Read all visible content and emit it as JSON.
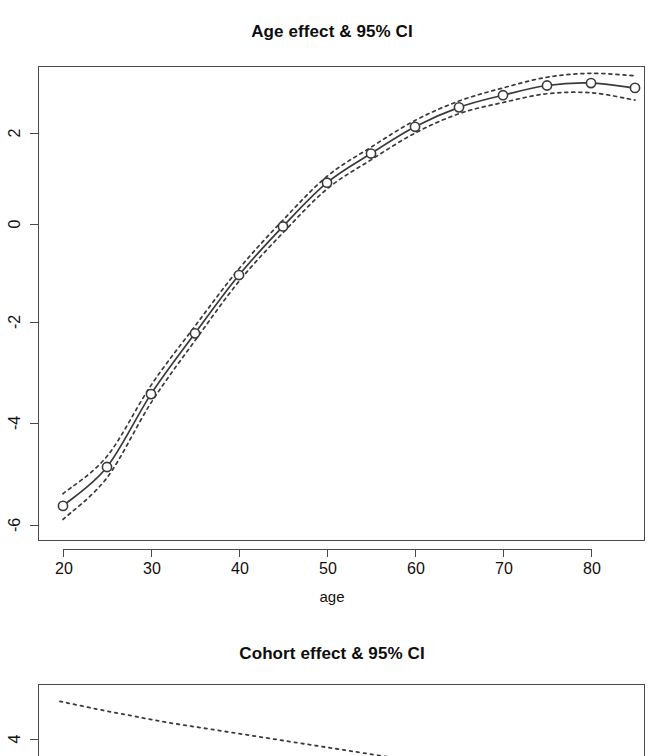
{
  "figure": {
    "background": "#ffffff",
    "line_color": "#3a3a3a",
    "box_color": "#4a4a4a",
    "text_color": "#111111"
  },
  "panels": [
    {
      "id": "age-panel",
      "title": "Age effect & 95% CI",
      "xlabel": "age",
      "ylabel": "",
      "x_ticks": [
        "20",
        "30",
        "40",
        "50",
        "60",
        "70",
        "80"
      ],
      "y_ticks": [
        "2",
        "0",
        "-2",
        "-4",
        "-6"
      ]
    },
    {
      "id": "cohort-panel",
      "title": "Cohort effect & 95% CI",
      "xlabel": "",
      "ylabel": "",
      "x_ticks": [],
      "y_ticks": [
        "4"
      ]
    }
  ],
  "chart_data": [
    {
      "type": "line",
      "title": "Age effect & 95% CI",
      "xlabel": "age",
      "ylabel": "",
      "grid": false,
      "legend": "none",
      "xlim": [
        17.5,
        87.5
      ],
      "ylim": [
        -6.5,
        3.4
      ],
      "xticks": [
        20,
        30,
        40,
        50,
        60,
        70,
        80
      ],
      "yticks": [
        2,
        0,
        -2,
        -4,
        -6
      ],
      "x": [
        20,
        25,
        30,
        35,
        40,
        45,
        50,
        55,
        60,
        65,
        70,
        75,
        80,
        85
      ],
      "series": [
        {
          "name": "Age effect (estimate)",
          "style": "solid-with-open-circle-markers",
          "values": [
            -5.8,
            -5.0,
            -3.5,
            -2.25,
            -1.05,
            -0.05,
            0.85,
            1.45,
            2.0,
            2.4,
            2.65,
            2.85,
            2.9,
            2.8
          ]
        },
        {
          "name": "Upper 95% CI",
          "style": "dotted",
          "values": [
            -5.55,
            -4.78,
            -3.32,
            -2.1,
            -0.92,
            0.08,
            0.98,
            1.58,
            2.13,
            2.53,
            2.8,
            3.02,
            3.1,
            3.05
          ]
        },
        {
          "name": "Lower 95% CI",
          "style": "dotted",
          "values": [
            -6.08,
            -5.22,
            -3.68,
            -2.4,
            -1.18,
            -0.18,
            0.72,
            1.32,
            1.87,
            2.27,
            2.5,
            2.68,
            2.7,
            2.55
          ]
        }
      ]
    },
    {
      "type": "line",
      "title": "Cohort effect & 95% CI",
      "xlabel": "",
      "ylabel": "",
      "grid": false,
      "legend": "none",
      "note": "panel is cropped by the bottom edge of the screenshot; only the upper-left portion of the declining dotted curve is visible",
      "yticks": [
        4
      ],
      "x": [
        1,
        2,
        3,
        4,
        5,
        6,
        7,
        8,
        9,
        10
      ],
      "series": [
        {
          "name": "Upper 95% CI",
          "style": "dotted",
          "values": [
            5.45,
            5.15,
            4.88,
            4.62,
            4.4,
            4.18,
            3.96,
            3.74,
            3.52,
            3.3
          ]
        }
      ]
    }
  ]
}
